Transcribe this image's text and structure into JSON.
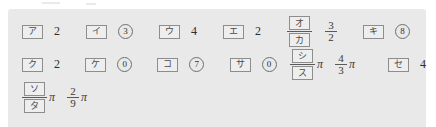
{
  "panel": {
    "background_color": "#e9e9e9",
    "box_border_color": "#8d8d8d"
  },
  "rows": [
    {
      "items": [
        {
          "label": "ア",
          "value": "2",
          "style": "plain"
        },
        {
          "label": "イ",
          "value": "3",
          "style": "circled"
        },
        {
          "label": "ウ",
          "value": "4",
          "style": "plain"
        },
        {
          "label": "エ",
          "value": "2",
          "style": "plain"
        },
        {
          "label_numerator": "オ",
          "label_denominator": "カ",
          "value_numerator": "3",
          "value_denominator": "2",
          "style": "fraction"
        },
        {
          "label": "キ",
          "value": "8",
          "style": "circled"
        }
      ]
    },
    {
      "items": [
        {
          "label": "ク",
          "value": "2",
          "style": "plain"
        },
        {
          "label": "ケ",
          "value": "0",
          "style": "circled"
        },
        {
          "label": "コ",
          "value": "7",
          "style": "circled"
        },
        {
          "label": "サ",
          "value": "0",
          "style": "circled"
        },
        {
          "label_numerator": "シ",
          "label_denominator": "ス",
          "value_numerator": "4",
          "value_denominator": "3",
          "suffix": "π",
          "style": "fraction-pi"
        },
        {
          "label": "セ",
          "value": "4",
          "style": "plain"
        }
      ]
    },
    {
      "items": [
        {
          "label_numerator": "ソ",
          "label_denominator": "タ",
          "value_numerator": "2",
          "value_denominator": "9",
          "suffix": "π",
          "style": "fraction-pi"
        }
      ]
    }
  ]
}
